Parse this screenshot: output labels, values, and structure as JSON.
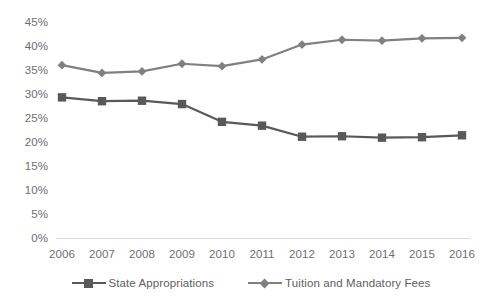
{
  "chart_data": {
    "type": "line",
    "title": "",
    "subtitle": "",
    "xlabel": "",
    "ylabel": "",
    "categories": [
      "2006",
      "2007",
      "2008",
      "2009",
      "2010",
      "2011",
      "2012",
      "2013",
      "2014",
      "2015",
      "2016"
    ],
    "x_tick_labels": [
      "2006",
      "2007",
      "2008",
      "2009",
      "2010",
      "2011",
      "2012",
      "2013",
      "2014",
      "2015",
      "2016"
    ],
    "y_tick_labels": [
      "45%",
      "40%",
      "35%",
      "30%",
      "25%",
      "20%",
      "15%",
      "10%",
      "5%",
      "0%"
    ],
    "y_tick_values": [
      45,
      40,
      35,
      30,
      25,
      20,
      15,
      10,
      5,
      0
    ],
    "ylim": [
      0,
      45
    ],
    "grid": false,
    "legend_position": "bottom",
    "series": [
      {
        "name": "State Appropriations",
        "marker": "square",
        "color": "#595959",
        "values": [
          29.3,
          28.5,
          28.6,
          27.9,
          24.2,
          23.4,
          21.1,
          21.2,
          20.9,
          21.0,
          21.4
        ]
      },
      {
        "name": "Tuition and Mandatory Fees",
        "marker": "diamond",
        "color": "#808080",
        "values": [
          36.0,
          34.4,
          34.7,
          36.3,
          35.8,
          37.2,
          40.3,
          41.3,
          41.1,
          41.6,
          41.7
        ]
      }
    ]
  },
  "legend": {
    "items": [
      {
        "label": "State Appropriations"
      },
      {
        "label": "Tuition and Mandatory Fees"
      }
    ]
  },
  "colors": {
    "series_state": "#595959",
    "series_tuition": "#808080",
    "axis": "#d9d9d9",
    "tick_text": "#6e6e6e",
    "background": "#ffffff"
  }
}
